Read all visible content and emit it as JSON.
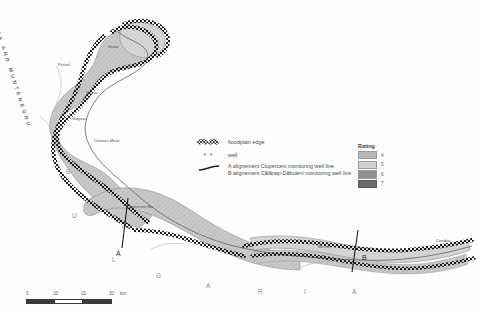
{
  "map": {
    "countries": {
      "serbia": "SERBIA AND MUNTENEGRU",
      "bulgaria_letters": [
        "B",
        "U",
        "L",
        "G",
        "A",
        "R",
        "I",
        "A"
      ]
    },
    "alignment_markers": {
      "a": "A",
      "b": "B"
    },
    "places": [
      {
        "name": "Gruia",
        "x": 108,
        "y": 48
      },
      {
        "name": "Pristol",
        "x": 60,
        "y": 66
      },
      {
        "name": "Salcia",
        "x": 88,
        "y": 92
      },
      {
        "name": "Gogosu",
        "x": 74,
        "y": 118
      },
      {
        "name": "Ostrovu Mare",
        "x": 96,
        "y": 140
      },
      {
        "name": "Ciuperceni No",
        "x": 128,
        "y": 206
      },
      {
        "name": "Desa",
        "x": 124,
        "y": 226
      },
      {
        "name": "Bechet",
        "x": 320,
        "y": 246
      },
      {
        "name": "Corabia",
        "x": 438,
        "y": 240
      }
    ]
  },
  "legend": {
    "items": [
      {
        "symbol": "floodplain-edge-hatch",
        "label": "floodplain edge"
      },
      {
        "symbol": "well-dot",
        "label": "well"
      }
    ],
    "alignment_lines": {
      "symbol": "alignment-line",
      "line_a": "A alignement Ciuperceni monitoring well line",
      "line_b": "B alignement Călăraşi-Dăbuleni monitoring well line"
    }
  },
  "rating": {
    "title": "Rating",
    "entries": [
      {
        "value": "4",
        "color": "#b9b9b9"
      },
      {
        "value": "5",
        "color": "#d2d2d2"
      },
      {
        "value": "6",
        "color": "#8f8f8f"
      },
      {
        "value": "7",
        "color": "#6a6a6a"
      }
    ]
  },
  "scale": {
    "ticks": [
      "0",
      "10",
      "20",
      "30"
    ],
    "unit": "km"
  }
}
